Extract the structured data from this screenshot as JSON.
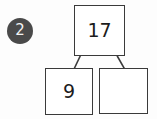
{
  "worksheet": {
    "problem_number": "2",
    "type": "number-bond",
    "whole": {
      "label": "whole-box",
      "value": "17",
      "filled": true
    },
    "parts": [
      {
        "label": "part-box-left",
        "value": "9",
        "filled": true
      },
      {
        "label": "part-box-right",
        "value": "",
        "filled": false
      }
    ],
    "colors": {
      "badge_fill": "#4a4a4a",
      "badge_text": "#f2f2f2",
      "box_border": "#3a3a3a",
      "box_fill": "#ffffff",
      "box_text": "#1c1c1c",
      "connector": "#3a3a3a",
      "background": "#fdfdfd"
    }
  }
}
